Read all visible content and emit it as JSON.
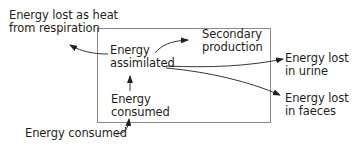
{
  "diagram": {
    "labels": {
      "heat_loss": [
        "Energy lost as heat",
        "from respiration"
      ],
      "assimilated": [
        "Energy",
        "assimilated"
      ],
      "secondary_production": [
        "Secondary",
        "production"
      ],
      "urine_loss": [
        "Energy lost",
        "in urine"
      ],
      "faeces_loss": [
        "Energy lost",
        "in faeces"
      ],
      "consumed_inner": [
        "Energy",
        "consumed"
      ],
      "consumed_outer": "Energy consumed"
    },
    "colors": {
      "line": "#231f20",
      "box": "#8a8a8a"
    }
  }
}
